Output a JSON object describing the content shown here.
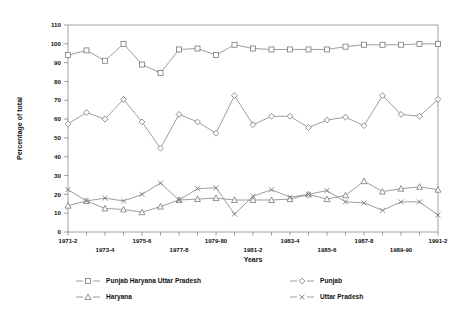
{
  "chart_data": {
    "type": "line",
    "title": "",
    "xlabel": "Years",
    "ylabel": "Percentage of total",
    "ylim": [
      0,
      110
    ],
    "ytick_step": 10,
    "yticks": [
      0,
      10,
      20,
      30,
      40,
      50,
      60,
      70,
      80,
      90,
      100,
      110
    ],
    "grid": false,
    "legend_position": "below-axes",
    "categories": [
      "1971-2",
      "1972-3",
      "1973-4",
      "1974-5",
      "1975-6",
      "1976-7",
      "1977-8",
      "1978-9",
      "1979-80",
      "1980-1",
      "1981-2",
      "1982-3",
      "1983-4",
      "1984-5",
      "1985-6",
      "1986-7",
      "1987-8",
      "1988-9",
      "1989-90",
      "1990-1",
      "1991-2"
    ],
    "xtick_labels_shown": [
      "1971-2",
      "1973-4",
      "1975-6",
      "1977-8",
      "1979-80",
      "1981-2",
      "1983-4",
      "1985-6",
      "1987-8",
      "1989-90",
      "1991-2"
    ],
    "series": [
      {
        "name": "Punjab Haryana Uttar Pradesh",
        "marker": "square",
        "values": [
          94,
          96.5,
          91,
          100,
          89,
          84.5,
          97,
          97.5,
          94,
          99.5,
          97.5,
          97,
          97,
          97,
          97,
          98.5,
          99.5,
          99.5,
          99.5,
          100,
          100
        ]
      },
      {
        "name": "Punjab",
        "marker": "diamond",
        "values": [
          57.5,
          63.5,
          60,
          70.5,
          58.5,
          44.5,
          62.5,
          58.5,
          52.5,
          72.5,
          57,
          61.5,
          61.5,
          55.5,
          59.5,
          61,
          56.5,
          72.5,
          62.5,
          61.5,
          70.5
        ]
      },
      {
        "name": "Haryana",
        "marker": "triangle",
        "values": [
          14,
          16.5,
          12.5,
          12,
          10.5,
          13.5,
          17,
          17.5,
          18,
          17,
          17,
          17,
          17.5,
          20,
          17.5,
          19.5,
          27,
          21.5,
          23,
          24,
          22.5
        ]
      },
      {
        "name": "Uttar Pradesh",
        "marker": "cross",
        "values": [
          22.5,
          16.5,
          18,
          16.5,
          20,
          26,
          17,
          23,
          23.5,
          9.5,
          19,
          22.5,
          18.5,
          20,
          22,
          16,
          15.5,
          11.5,
          16,
          16,
          9
        ]
      }
    ]
  },
  "legend": {
    "entries": [
      {
        "label": "Punjab Haryana Uttar  Pradesh",
        "marker": "square"
      },
      {
        "label": "Punjab",
        "marker": "diamond"
      },
      {
        "label": "Haryana",
        "marker": "triangle"
      },
      {
        "label": "Uttar Pradesh",
        "marker": "cross"
      }
    ]
  }
}
